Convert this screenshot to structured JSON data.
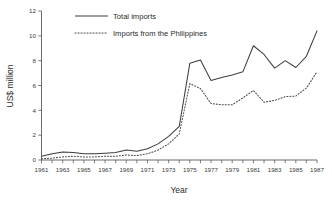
{
  "chart_data": {
    "type": "line",
    "title": "",
    "subtitle": "",
    "xlabel": "Year",
    "ylabel": "US$ million",
    "xlim": [
      1961,
      1987
    ],
    "ylim": [
      0,
      12
    ],
    "yticks": [
      0,
      2,
      4,
      6,
      8,
      10,
      12
    ],
    "ytick_labels": [
      "0",
      "2",
      "4",
      "6",
      "8",
      "10",
      "12"
    ],
    "xticks": [
      1961,
      1962,
      1963,
      1964,
      1965,
      1966,
      1967,
      1968,
      1969,
      1970,
      1971,
      1972,
      1973,
      1974,
      1975,
      1976,
      1977,
      1978,
      1979,
      1980,
      1981,
      1982,
      1983,
      1984,
      1985,
      1986,
      1987
    ],
    "xtick_labels_shown": [
      "1961",
      "1963",
      "1965",
      "1967",
      "1969",
      "1971",
      "1973",
      "1975",
      "1977",
      "1979",
      "1981",
      "1983",
      "1985",
      "1987"
    ],
    "grid": false,
    "legend_position": "top-left-inside",
    "x": [
      1961,
      1962,
      1963,
      1964,
      1965,
      1966,
      1967,
      1968,
      1969,
      1970,
      1971,
      1972,
      1973,
      1974,
      1975,
      1976,
      1977,
      1978,
      1979,
      1980,
      1981,
      1982,
      1983,
      1984,
      1985,
      1986,
      1987
    ],
    "series": [
      {
        "name": "Total imports",
        "style": "solid",
        "color": "#3d3d3d",
        "values": [
          0.3,
          0.5,
          0.65,
          0.6,
          0.5,
          0.5,
          0.55,
          0.6,
          0.8,
          0.7,
          0.9,
          1.3,
          1.9,
          2.7,
          7.8,
          8.05,
          6.4,
          6.65,
          6.85,
          7.1,
          9.2,
          8.5,
          7.4,
          8.0,
          7.45,
          8.35,
          10.4
        ]
      },
      {
        "name": "Imports from the Philippines",
        "style": "dotted",
        "color": "#4a4a4a",
        "values": [
          0.1,
          0.15,
          0.25,
          0.3,
          0.25,
          0.25,
          0.3,
          0.3,
          0.4,
          0.35,
          0.5,
          0.8,
          1.3,
          2.1,
          6.15,
          5.75,
          4.55,
          4.45,
          4.45,
          5.0,
          5.6,
          4.65,
          4.8,
          5.1,
          5.15,
          5.8,
          7.1
        ]
      }
    ],
    "legend": [
      {
        "label": "Total imports",
        "style": "solid"
      },
      {
        "label": "Imports from the Philippines",
        "style": "dotted"
      }
    ]
  },
  "colors": {
    "background": "#ffffff",
    "axis": "#5a5a5a",
    "text": "#2b2b2b",
    "series_total": "#3d3d3d",
    "series_philippines": "#4a4a4a"
  }
}
